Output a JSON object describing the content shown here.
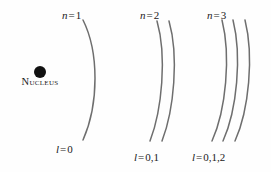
{
  "figure": {
    "background_color": "#fefefe",
    "curve_color": "#6e6e6e",
    "text_color": "#1a1a1a"
  },
  "nucleus": {
    "label": "Nucleus",
    "dot_color": "#111111",
    "cx": 40,
    "cy": 72,
    "r": 6
  },
  "shells": [
    {
      "id": "n1",
      "n_label_sym": "n",
      "n_label_eq": "=",
      "n_label_val": "1",
      "l_label_sym": "l",
      "l_label_eq": "=",
      "l_label_val": "0",
      "arc_count": 1,
      "arcs": [
        "M 83 20 C 99 52, 99 104, 83 140"
      ]
    },
    {
      "id": "n2",
      "n_label_sym": "n",
      "n_label_eq": "=",
      "n_label_val": "2",
      "l_label_sym": "l",
      "l_label_eq": "=",
      "l_label_val": "0,1",
      "arc_count": 2,
      "arcs": [
        "M 157 21 C 167 56, 162 110, 150 141",
        "M 169 21 C 179 56, 174 110, 162 141"
      ]
    },
    {
      "id": "n3",
      "n_label_sym": "n",
      "n_label_eq": "=",
      "n_label_val": "3",
      "l_label_sym": "l",
      "l_label_eq": "=",
      "l_label_val": "0,1,2",
      "arc_count": 3,
      "arcs": [
        "M 222 20 C 231 56, 226 110, 212 141",
        "M 233 20 C 242 56, 237 110, 223 141",
        "M 245 20 C 254 56, 249 110, 235 141"
      ]
    }
  ]
}
